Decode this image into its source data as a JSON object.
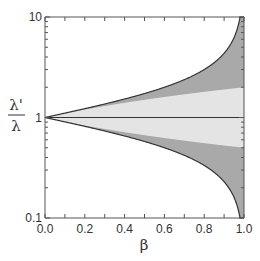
{
  "chart_data": {
    "type": "area",
    "title": "",
    "xlabel": "β",
    "ylabel_numerator": "λ'",
    "ylabel_denominator": "λ",
    "xlim": [
      0.0,
      1.0
    ],
    "ylim": [
      0.1,
      10
    ],
    "yscale": "log",
    "grid": false,
    "legend": "none",
    "x_ticks": [
      "0.0",
      "0.2",
      "0.4",
      "0.6",
      "0.8",
      "1.0"
    ],
    "y_ticks": [
      "0.1",
      "1",
      "10"
    ],
    "x": [
      0.0,
      0.1,
      0.2,
      0.3,
      0.4,
      0.5,
      0.6,
      0.7,
      0.8,
      0.9,
      0.95,
      0.99,
      1.0
    ],
    "series": [
      {
        "name": "upper outer bound sqrt((1+β)/(1-β))",
        "values": [
          1.0,
          1.106,
          1.225,
          1.363,
          1.528,
          1.732,
          2.0,
          2.38,
          3.0,
          4.359,
          6.245,
          14.1,
          10
        ]
      },
      {
        "name": "upper inner bound (1+β)",
        "values": [
          1.0,
          1.1,
          1.2,
          1.3,
          1.4,
          1.5,
          1.6,
          1.7,
          1.8,
          1.9,
          1.95,
          1.99,
          2.0
        ]
      },
      {
        "name": "center line",
        "values": [
          1,
          1,
          1,
          1,
          1,
          1,
          1,
          1,
          1,
          1,
          1,
          1,
          1
        ]
      },
      {
        "name": "lower inner bound 1/(1+β)",
        "values": [
          1.0,
          0.909,
          0.833,
          0.769,
          0.714,
          0.667,
          0.625,
          0.588,
          0.556,
          0.526,
          0.513,
          0.503,
          0.5
        ]
      },
      {
        "name": "lower outer bound sqrt((1-β)/(1+β))",
        "values": [
          1.0,
          0.905,
          0.816,
          0.734,
          0.655,
          0.577,
          0.5,
          0.42,
          0.333,
          0.229,
          0.16,
          0.071,
          0.1
        ]
      }
    ],
    "fills": {
      "outer_band_color": "#a9a9a9",
      "inner_band_color": "#e4e4e4",
      "line_color": "#333333"
    }
  }
}
